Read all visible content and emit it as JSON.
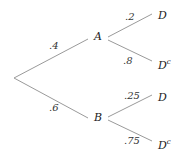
{
  "diagram": {
    "type": "probability-tree",
    "root": {
      "branches": [
        {
          "label": "A",
          "prob": ".4",
          "children": [
            {
              "label": "D",
              "sup": "",
              "prob": ".2"
            },
            {
              "label": "D",
              "sup": "c",
              "prob": ".8"
            }
          ]
        },
        {
          "label": "B",
          "prob": ".6",
          "children": [
            {
              "label": "D",
              "sup": "",
              "prob": ".25"
            },
            {
              "label": "D",
              "sup": "c",
              "prob": ".75"
            }
          ]
        }
      ]
    },
    "colors": {
      "line": "#9a9a9a",
      "text": "#222222",
      "background": "#ffffff"
    }
  }
}
